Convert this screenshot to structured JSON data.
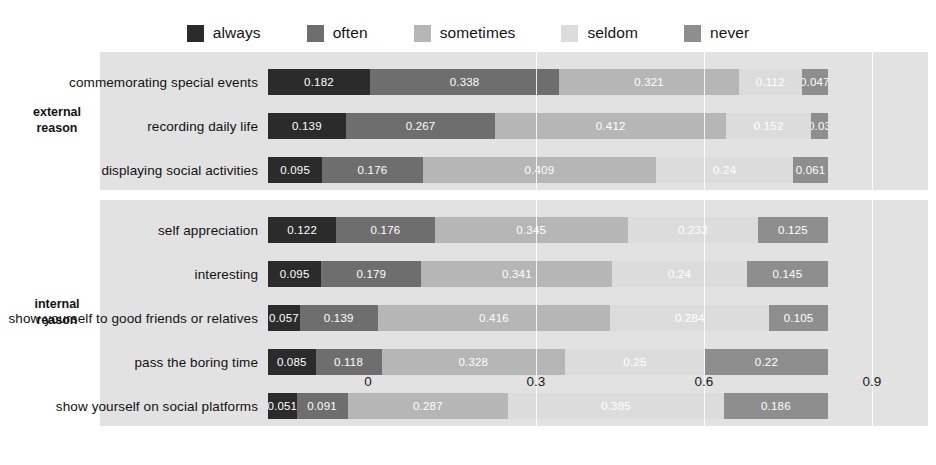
{
  "legend": {
    "position": "top-center",
    "items": [
      {
        "label": "always",
        "color": "#2b2b2b"
      },
      {
        "label": "often",
        "color": "#6e6e6e"
      },
      {
        "label": "sometimes",
        "color": "#b6b6b6"
      },
      {
        "label": "seldom",
        "color": "#dcdcdc"
      },
      {
        "label": "never",
        "color": "#8e8e8e"
      }
    ]
  },
  "groups": [
    {
      "label": "external\nreason",
      "rows": [
        0,
        1,
        2
      ]
    },
    {
      "label": "internal\nreason",
      "rows": [
        3,
        4,
        5,
        6,
        7
      ]
    }
  ],
  "axis": {
    "ticks": [
      "0",
      "0.3",
      "0.6",
      "0.9"
    ],
    "tick_values": [
      0,
      0.3,
      0.6,
      0.9
    ],
    "xlim": [
      0,
      1.0
    ]
  },
  "chart_data": {
    "type": "bar",
    "orientation": "horizontal",
    "stacked": true,
    "title": "",
    "xlabel": "",
    "ylabel": "",
    "xlim": [
      0,
      1.0
    ],
    "grid": true,
    "legend_position": "top",
    "categories": [
      "commemorating special events",
      "recording daily life",
      "displaying social activities",
      "self appreciation",
      "interesting",
      "show yourself to good friends or relatives",
      "pass the boring time",
      "show yourself on social platforms"
    ],
    "facets": [
      {
        "name": "external reason",
        "categories": [
          "commemorating special events",
          "recording daily life",
          "displaying social activities"
        ]
      },
      {
        "name": "internal reason",
        "categories": [
          "self appreciation",
          "interesting",
          "show yourself to good friends or relatives",
          "pass the boring time",
          "show yourself on social platforms"
        ]
      }
    ],
    "series": [
      {
        "name": "always",
        "color": "#2b2b2b",
        "values": [
          0.182,
          0.139,
          0.095,
          0.122,
          0.095,
          0.057,
          0.085,
          0.051
        ]
      },
      {
        "name": "often",
        "color": "#6e6e6e",
        "values": [
          0.338,
          0.267,
          0.176,
          0.176,
          0.179,
          0.139,
          0.118,
          0.091
        ]
      },
      {
        "name": "sometimes",
        "color": "#b6b6b6",
        "values": [
          0.321,
          0.412,
          0.409,
          0.345,
          0.341,
          0.416,
          0.328,
          0.287
        ]
      },
      {
        "name": "seldom",
        "color": "#dcdcdc",
        "values": [
          0.112,
          0.152,
          0.24,
          0.233,
          0.24,
          0.284,
          0.25,
          0.385
        ]
      },
      {
        "name": "never",
        "color": "#8e8e8e",
        "values": [
          0.047,
          0.03,
          0.061,
          0.125,
          0.145,
          0.105,
          0.22,
          0.186
        ]
      }
    ],
    "bar_labels": [
      [
        "0.182",
        "0.338",
        "0.321",
        "0.112",
        "0.047"
      ],
      [
        "0.139",
        "0.267",
        "0.412",
        "0.152",
        "0.03"
      ],
      [
        "0.095",
        "0.176",
        "0.409",
        "0.24",
        "0.061"
      ],
      [
        "0.122",
        "0.176",
        "0.345",
        "0.233",
        "0.125"
      ],
      [
        "0.095",
        "0.179",
        "0.341",
        "0.24",
        "0.145"
      ],
      [
        "0.057",
        "0.139",
        "0.416",
        "0.284",
        "0.105"
      ],
      [
        "0.085",
        "0.118",
        "0.328",
        "0.25",
        "0.22"
      ],
      [
        "0.051",
        "0.091",
        "0.287",
        "0.385",
        "0.186"
      ]
    ]
  }
}
